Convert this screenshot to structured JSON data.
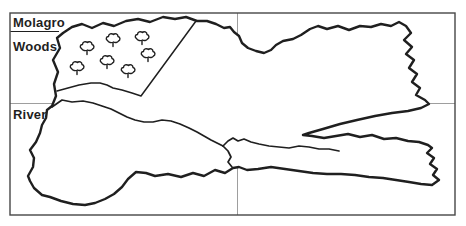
{
  "legend": {
    "title": "Molagro",
    "items": [
      {
        "label": "Woods"
      },
      {
        "label": "River"
      }
    ]
  },
  "map": {
    "ink_color": "#1f1f1f",
    "frame_color": "#474747",
    "grid_color": "#9e9e9e",
    "paper_color": "#ffffff",
    "tree_count": 7,
    "trees": [
      [
        87,
        48
      ],
      [
        113,
        40
      ],
      [
        142,
        38
      ],
      [
        77,
        68
      ],
      [
        107,
        62
      ],
      [
        128,
        71
      ],
      [
        148,
        55
      ]
    ]
  }
}
